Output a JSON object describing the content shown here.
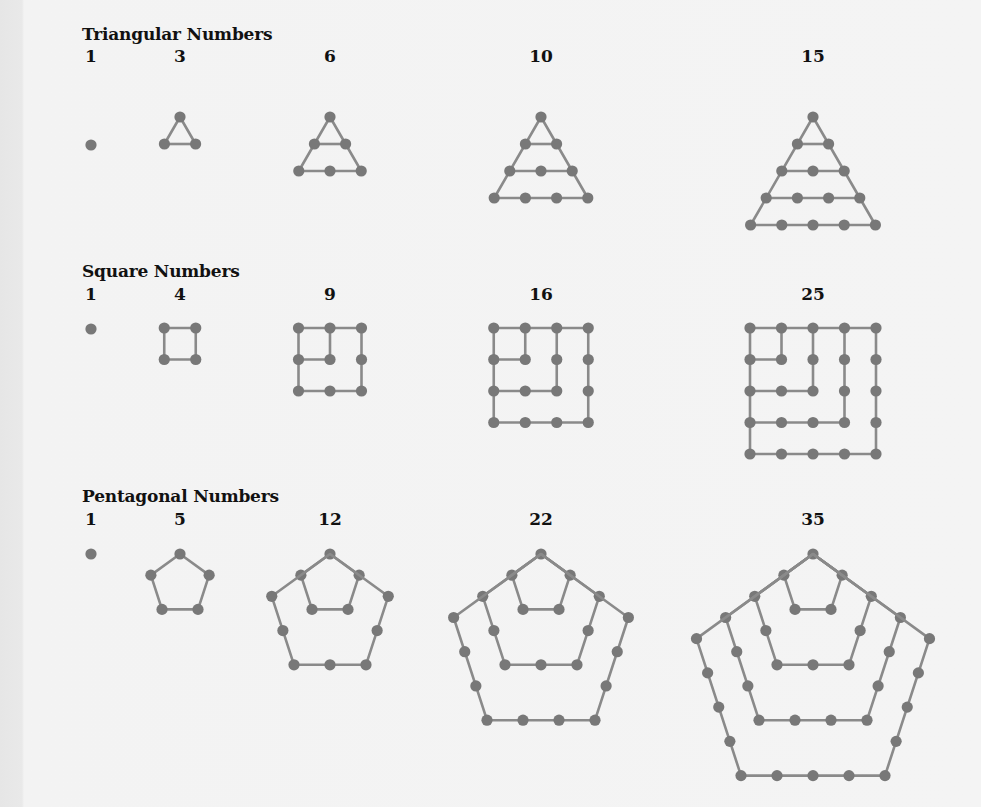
{
  "sections": [
    {
      "title": "Triangular Numbers",
      "numbers": [
        "1",
        "3",
        "6",
        "10",
        "15"
      ],
      "n": [
        1,
        2,
        3,
        4,
        5
      ]
    },
    {
      "title": "Square Numbers",
      "numbers": [
        "1",
        "4",
        "9",
        "16",
        "25"
      ],
      "n": [
        1,
        2,
        3,
        4,
        5
      ]
    },
    {
      "title": "Pentagonal Numbers",
      "numbers": [
        "1",
        "5",
        "12",
        "22",
        "35"
      ],
      "n": [
        1,
        2,
        3,
        4,
        5
      ]
    }
  ],
  "colors": {
    "dot": "#787878",
    "line": "#8a8a8a",
    "background": "#f3f3f3",
    "text": "#111111"
  }
}
